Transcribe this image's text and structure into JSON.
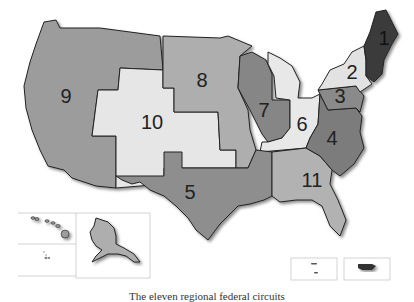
{
  "map": {
    "title": "Federal judicial circuits",
    "caption": "The eleven regional federal circuits",
    "circuits": [
      {
        "id": "1",
        "label": "1",
        "shade": "#3a3a3a"
      },
      {
        "id": "2",
        "label": "2",
        "shade": "#e2e2e2"
      },
      {
        "id": "3",
        "label": "3",
        "shade": "#8a8a8a"
      },
      {
        "id": "4",
        "label": "4",
        "shade": "#7c7c7c"
      },
      {
        "id": "5",
        "label": "5",
        "shade": "#8e8e8e"
      },
      {
        "id": "6",
        "label": "6",
        "shade": "#e8e8e8"
      },
      {
        "id": "7",
        "label": "7",
        "shade": "#868686"
      },
      {
        "id": "8",
        "label": "8",
        "shade": "#aeaeae"
      },
      {
        "id": "9",
        "label": "9",
        "shade": "#9c9c9c"
      },
      {
        "id": "10",
        "label": "10",
        "shade": "#e6e6e6"
      },
      {
        "id": "11",
        "label": "11",
        "shade": "#b2b2b2"
      }
    ],
    "insets": [
      "Hawaii",
      "Alaska",
      "Guam / Northern Mariana Islands",
      "Puerto Rico / Virgin Islands"
    ]
  }
}
